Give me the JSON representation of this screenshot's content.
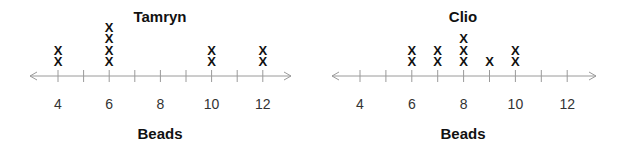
{
  "chart_data": [
    {
      "type": "dot-plot",
      "title": "Tamryn",
      "xlabel": "Beads",
      "ylabel": "",
      "tick_values": [
        4,
        5,
        6,
        7,
        8,
        9,
        10,
        11,
        12
      ],
      "tick_labels": [
        "4",
        "6",
        "8",
        "10",
        "12"
      ],
      "labeled_ticks": [
        4,
        6,
        8,
        10,
        12
      ],
      "xlim": [
        3,
        13
      ],
      "grid": false,
      "marker": "X",
      "x": [
        4,
        6,
        10,
        12
      ],
      "counts": [
        2,
        4,
        2,
        2
      ]
    },
    {
      "type": "dot-plot",
      "title": "Clio",
      "xlabel": "Beads",
      "ylabel": "",
      "tick_values": [
        4,
        5,
        6,
        7,
        8,
        9,
        10,
        11,
        12
      ],
      "tick_labels": [
        "4",
        "6",
        "8",
        "10",
        "12"
      ],
      "labeled_ticks": [
        4,
        6,
        8,
        10,
        12
      ],
      "xlim": [
        3,
        13
      ],
      "grid": false,
      "marker": "X",
      "x": [
        6,
        7,
        8,
        9,
        10
      ],
      "counts": [
        2,
        2,
        3,
        1,
        2
      ]
    }
  ],
  "colors": {
    "axis": "#9a9a9a",
    "marks": "#111111",
    "text": "#333333"
  }
}
